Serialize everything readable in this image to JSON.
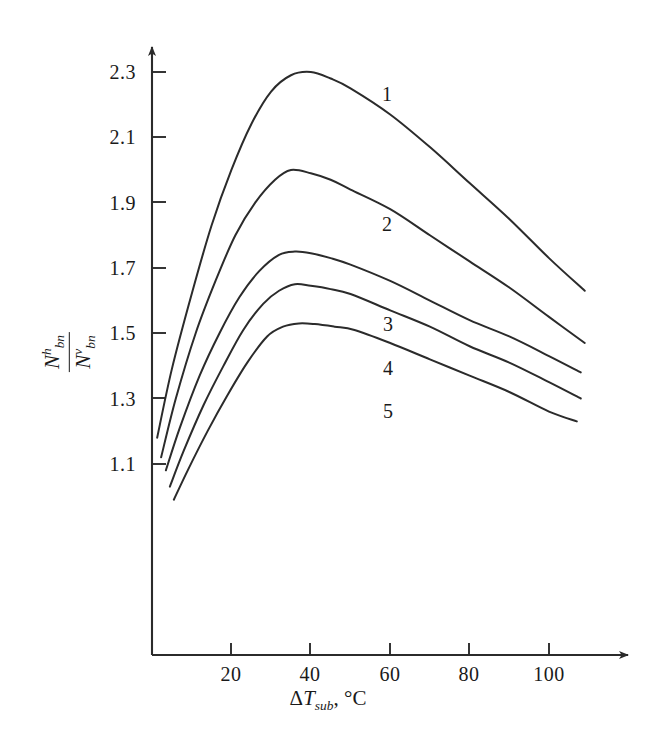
{
  "chart_data": {
    "type": "line",
    "title": "",
    "xlabel": "ΔT_sub, °C",
    "ylabel": "N^h_bn / N^v_bn",
    "xlim": [
      0,
      118
    ],
    "ylim": [
      1.0,
      2.37
    ],
    "grid": false,
    "legend_position": "inline-curve-labels",
    "x_ticks": [
      20,
      40,
      60,
      80,
      100
    ],
    "x_tick_labels": [
      "20",
      "40",
      "60",
      "80",
      "100"
    ],
    "y_ticks": [
      1.1,
      1.3,
      1.5,
      1.7,
      1.9,
      2.1,
      2.3
    ],
    "y_tick_labels": [
      "1.1",
      "1.3",
      "1.5",
      "1.7",
      "1.9",
      "2.1",
      "2.3"
    ],
    "series": [
      {
        "name": "1",
        "label": "1",
        "x": [
          1.3,
          5,
          10,
          15,
          20,
          25,
          30,
          35,
          40,
          45,
          50,
          60,
          70,
          80,
          90,
          100,
          109
        ],
        "y": [
          1.18,
          1.39,
          1.62,
          1.83,
          2.0,
          2.14,
          2.24,
          2.29,
          2.3,
          2.28,
          2.25,
          2.17,
          2.07,
          1.96,
          1.85,
          1.73,
          1.63
        ]
      },
      {
        "name": "2",
        "label": "2",
        "x": [
          2.3,
          6,
          11,
          16,
          21,
          26,
          31,
          35,
          40,
          45,
          50,
          60,
          70,
          80,
          90,
          100,
          109
        ],
        "y": [
          1.12,
          1.3,
          1.5,
          1.66,
          1.8,
          1.9,
          1.97,
          2.0,
          1.99,
          1.97,
          1.94,
          1.88,
          1.8,
          1.72,
          1.64,
          1.55,
          1.47
        ]
      },
      {
        "name": "3",
        "label": "3",
        "x": [
          3.5,
          7,
          12,
          17,
          22,
          27,
          32,
          36,
          40,
          45,
          50,
          60,
          70,
          80,
          90,
          100,
          108
        ],
        "y": [
          1.08,
          1.21,
          1.37,
          1.5,
          1.61,
          1.69,
          1.74,
          1.75,
          1.745,
          1.73,
          1.71,
          1.66,
          1.6,
          1.54,
          1.49,
          1.43,
          1.38
        ]
      },
      {
        "name": "4",
        "label": "4",
        "x": [
          4.5,
          8,
          13,
          18,
          23,
          28,
          32,
          36,
          40,
          45,
          50,
          60,
          70,
          80,
          90,
          100,
          108
        ],
        "y": [
          1.03,
          1.14,
          1.28,
          1.4,
          1.51,
          1.59,
          1.63,
          1.65,
          1.645,
          1.635,
          1.62,
          1.57,
          1.52,
          1.46,
          1.41,
          1.35,
          1.3
        ]
      },
      {
        "name": "5",
        "label": "5",
        "x": [
          5.5,
          9,
          14,
          19,
          24,
          29,
          33,
          37,
          41,
          46,
          51,
          60,
          70,
          80,
          90,
          100,
          107
        ],
        "y": [
          0.99,
          1.08,
          1.2,
          1.31,
          1.41,
          1.49,
          1.52,
          1.53,
          1.528,
          1.52,
          1.51,
          1.47,
          1.42,
          1.37,
          1.32,
          1.26,
          1.23
        ]
      }
    ]
  },
  "axes": {
    "y_ticks": [
      {
        "label": "2.3",
        "top": 61
      },
      {
        "label": "2.1",
        "top": 126
      },
      {
        "label": "1.9",
        "top": 192
      },
      {
        "label": "1.7",
        "top": 257
      },
      {
        "label": "1.5",
        "top": 322
      },
      {
        "label": "1.3",
        "top": 388
      },
      {
        "label": "1.1",
        "top": 453
      }
    ],
    "x_ticks": [
      {
        "label": "20",
        "left": 208
      },
      {
        "label": "40",
        "left": 287
      },
      {
        "label": "60",
        "left": 367
      },
      {
        "label": "80",
        "left": 446
      },
      {
        "label": "100",
        "left": 526
      }
    ]
  },
  "y_axis_label": {
    "numerator_symbol": "N",
    "numerator_sup": "h",
    "numerator_sub": "bn",
    "denominator_symbol": "N",
    "denominator_sup": "v",
    "denominator_sub": "bn"
  },
  "x_axis_label": {
    "delta": "Δ",
    "symbol": "T",
    "subscript": "sub",
    "unit": ", °C"
  },
  "curve_labels": [
    {
      "text": "1",
      "left": 377,
      "top": 83
    },
    {
      "text": "2",
      "left": 377,
      "top": 213
    },
    {
      "text": "3",
      "left": 378,
      "top": 313
    },
    {
      "text": "4",
      "left": 378,
      "top": 357
    },
    {
      "text": "5",
      "left": 378,
      "top": 400
    }
  ],
  "colors": {
    "line": "#2b2b2b",
    "axis": "#2b2b2b",
    "background": "#ffffff",
    "text": "#1a1a1a"
  }
}
